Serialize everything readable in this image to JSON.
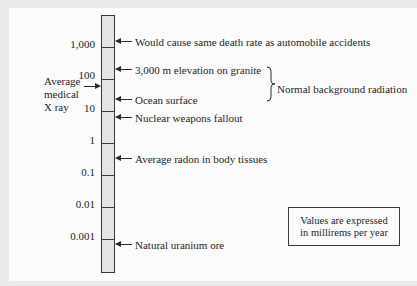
{
  "diagram": {
    "type": "logarithmic radiation dose scale",
    "scale_labels": [
      "1,000",
      "100",
      "10",
      "1",
      "0.1",
      "0.01",
      "0.001"
    ],
    "annotations": [
      {
        "label": "Would cause same death rate as automobile accidents"
      },
      {
        "label": "3,000 m elevation on granite"
      },
      {
        "label": "Ocean surface"
      },
      {
        "label": "Nuclear weapons fallout"
      },
      {
        "label": "Average radon in body tissues"
      },
      {
        "label": "Natural uranium ore"
      }
    ],
    "left_annotation": {
      "line1": "Average",
      "line2": "medical",
      "line3": "X ray"
    },
    "brace_label": "Normal background radiation",
    "units_note": {
      "line1": "Values are expressed",
      "line2": "in millirems per year"
    }
  }
}
